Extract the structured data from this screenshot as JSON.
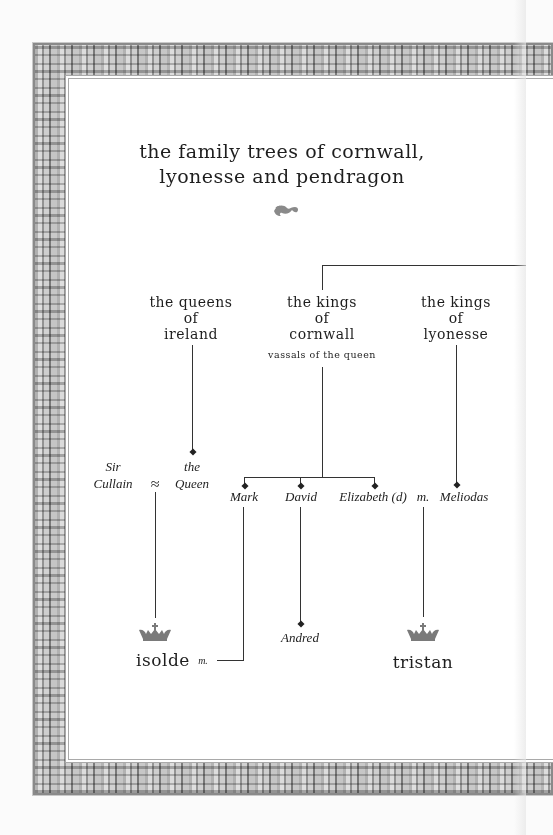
{
  "title": {
    "line1": "the family trees of cornwall,",
    "line2": "lyonesse and pendragon"
  },
  "ornament": {
    "icon": "fleuron-ornament-icon"
  },
  "headers": {
    "ireland": {
      "line1": "the queens",
      "line2": "of",
      "line3": "ireland"
    },
    "cornwall": {
      "line1": "the kings",
      "line2": "of",
      "line3": "cornwall",
      "note": "vassals of the queen"
    },
    "lyonesse": {
      "line1": "the kings",
      "line2": "of",
      "line3": "lyonesse"
    }
  },
  "people": {
    "sir_cullain": {
      "line1": "Sir",
      "line2": "Cullain"
    },
    "union_symbol": "≈",
    "the_queen": {
      "line1": "the",
      "line2": "Queen"
    },
    "mark": "Mark",
    "david": "David",
    "elizabeth": "Elizabeth (d)",
    "married_1": "m.",
    "meliodas": "Meliodas",
    "andred": "Andred",
    "isolde": "isolde",
    "married_2": "m.",
    "tristan": "tristan"
  },
  "icons": {
    "crown": "crown-icon"
  },
  "colors": {
    "ink": "#222222",
    "frame": "#9a9a9a",
    "crown": "#777777",
    "page": "#ffffff"
  }
}
